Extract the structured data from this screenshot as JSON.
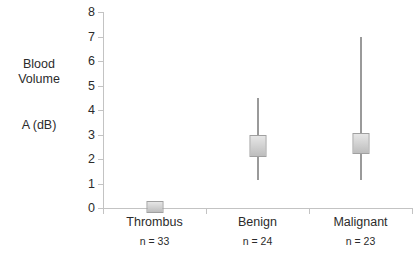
{
  "chart_data": {
    "type": "bar",
    "title": "",
    "xlabel": "",
    "ylabel": "Blood Volume A (dB)",
    "ylabel_lines": [
      "Blood",
      "Volume",
      "A (dB)"
    ],
    "ylim": [
      0,
      8
    ],
    "yticks": [
      0,
      1,
      2,
      3,
      4,
      5,
      6,
      7,
      8
    ],
    "ytick_labels": [
      "0",
      "1",
      "2",
      "3",
      "4",
      "5",
      "6",
      "7",
      "8"
    ],
    "grid": false,
    "legend": "none",
    "categories": [
      "Thrombus",
      "Benign",
      "Malignant"
    ],
    "sample_sizes": [
      "n = 33",
      "n = 24",
      "n = 23"
    ],
    "series": [
      {
        "name": "Blood Volume A (dB)",
        "points": [
          {
            "category": "Thrombus",
            "n_label": "n = 33",
            "box_low": -0.2,
            "box_high": 0.3,
            "median": 0.05,
            "whisker_low": -0.2,
            "whisker_high": 0.3
          },
          {
            "category": "Benign",
            "n_label": "n = 24",
            "box_low": 2.1,
            "box_high": 3.0,
            "median": 2.55,
            "whisker_low": 1.15,
            "whisker_high": 4.5
          },
          {
            "category": "Malignant",
            "n_label": "n = 23",
            "box_low": 2.2,
            "box_high": 3.05,
            "median": 2.65,
            "whisker_low": 1.15,
            "whisker_high": 7.0
          }
        ]
      }
    ],
    "colors": {
      "box_fill_light": "#e6e6e6",
      "box_fill_dark": "#bdbdbd",
      "box_border": "#a0a0a0",
      "whisker": "#9a9a9a",
      "axis": "#c3c3c3",
      "text": "#2b2b2b"
    }
  }
}
